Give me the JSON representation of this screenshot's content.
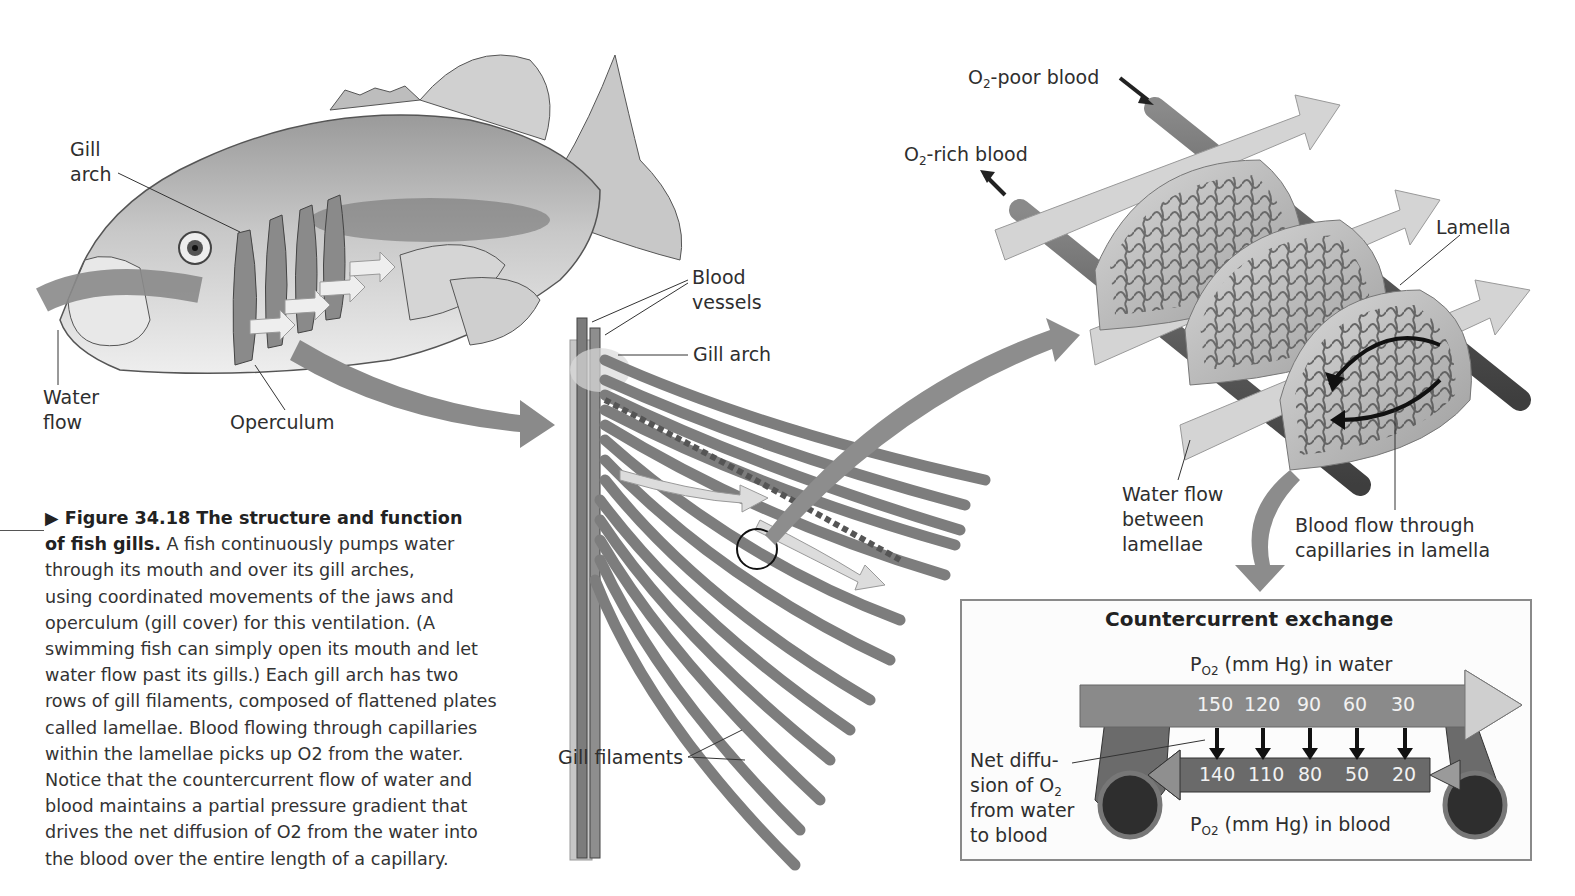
{
  "figure": {
    "number_label": "Figure 34.18",
    "title": "The structure and function of fish gills.",
    "caption_lines": [
      "A fish continuously pumps water",
      "through its mouth and over its gill arches,",
      "using coordinated movements of the jaws and",
      "operculum (gill cover) for this ventilation. (A",
      "swimming fish can simply open its mouth and let",
      "water flow past its gills.) Each gill arch has two",
      "rows of gill filaments, composed of flattened plates",
      "called lamellae. Blood flowing through capillaries",
      "within the lamellae picks up O2 from the water.",
      "Notice that the countercurrent flow of water and",
      "blood maintains a partial pressure gradient that",
      "drives the net diffusion of O2 from the water into",
      "the blood over the entire length of a capillary."
    ],
    "caption_title_line1": "Figure 34.18 The structure and function",
    "caption_title_line2": "of fish gills.",
    "caption_first_tail": " A fish continuously pumps water"
  },
  "fish_panel": {
    "labels": {
      "gill_arch_1": "Gill",
      "gill_arch_2": "arch",
      "water_flow_1": "Water",
      "water_flow_2": "flow",
      "operculum": "Operculum"
    }
  },
  "gill_panel": {
    "labels": {
      "blood_vessels_1": "Blood",
      "blood_vessels_2": "vessels",
      "gill_arch": "Gill arch",
      "gill_filaments": "Gill filaments"
    }
  },
  "lamella_panel": {
    "labels": {
      "o2_poor_prefix": "O",
      "o2_poor_sub": "2",
      "o2_poor_suffix": "-poor blood",
      "o2_rich_prefix": "O",
      "o2_rich_sub": "2",
      "o2_rich_suffix": "-rich blood",
      "lamella": "Lamella",
      "water_between_1": "Water flow",
      "water_between_2": "between",
      "water_between_3": "lamellae",
      "blood_flow_1": "Blood flow through",
      "blood_flow_2": "capillaries in lamella"
    }
  },
  "countercurrent": {
    "title": "Countercurrent exchange",
    "water_label_prefix": "P",
    "water_label_sub": "O2",
    "water_label_suffix": " (mm Hg) in water",
    "blood_label_prefix": "P",
    "blood_label_sub": "O2",
    "blood_label_suffix": " (mm Hg) in blood",
    "water_values": [
      "150",
      "120",
      "90",
      "60",
      "30"
    ],
    "blood_values": [
      "140",
      "110",
      "80",
      "50",
      "20"
    ],
    "net_diffusion_1": "Net diffu-",
    "net_diffusion_2": "sion of O",
    "net_diffusion_2_sub": "2",
    "net_diffusion_3": "from water",
    "net_diffusion_4": "to blood"
  },
  "colors": {
    "arrow_gray": "#8c8c8c",
    "light_arrow": "#d6d6d6",
    "vessel_dark": "#5e5e5e",
    "box_border": "#8a8a8a",
    "text": "#2e2e2e"
  }
}
